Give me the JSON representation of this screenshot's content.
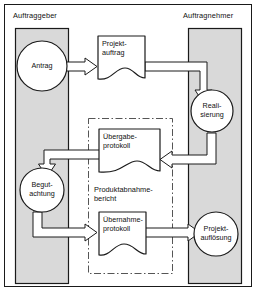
{
  "diagram": {
    "title_alt": "Auftraggeber / Auftragnehmer Projektablauf",
    "type": "flow-diagram",
    "colors": {
      "swimlane_fill": "#d9d9d9",
      "swimlane_stroke": "#1a1a1a",
      "node_fill": "#ffffff",
      "node_stroke": "#1a1a1a",
      "arrow_fill": "#ffffff",
      "arrow_stroke": "#1a1a1a",
      "group_stroke": "#555555",
      "frame_stroke": "#1a1a1a",
      "text": "#111111",
      "page_background": "#ffffff"
    },
    "swimlanes": [
      {
        "id": "auftraggeber",
        "label": "Auftraggeber"
      },
      {
        "id": "auftragnehmer",
        "label": "Auftragnehmer"
      }
    ],
    "group": {
      "id": "produktabnahmebericht",
      "label_line1": "Produktabnahme-",
      "label_line2": "bericht",
      "border_style": "dash-dot"
    },
    "nodes": [
      {
        "id": "antrag",
        "shape": "circle",
        "lane": "auftraggeber",
        "label_line1": "Antrag",
        "label_line2": ""
      },
      {
        "id": "projektauftrag",
        "shape": "document",
        "lane": "between",
        "label_line1": "Projekt-",
        "label_line2": "auftrag"
      },
      {
        "id": "realisierung",
        "shape": "circle",
        "lane": "auftragnehmer",
        "label_line1": "Reali-",
        "label_line2": "sierung"
      },
      {
        "id": "uebergabeprotokoll",
        "shape": "document",
        "lane": "between",
        "label_line1": "Übergabe-",
        "label_line2": "protokoll"
      },
      {
        "id": "begutachtung",
        "shape": "circle",
        "lane": "auftraggeber",
        "label_line1": "Begut-",
        "label_line2": "achtung"
      },
      {
        "id": "uebernahmeprotokoll",
        "shape": "document",
        "lane": "between",
        "label_line1": "Übernahme-",
        "label_line2": "protokoll"
      },
      {
        "id": "projektaufloesung",
        "shape": "circle",
        "lane": "auftragnehmer",
        "label_line1": "Projekt-",
        "label_line2": "auflösung"
      }
    ],
    "edges": [
      {
        "id": "antrag-to-projektauftrag",
        "from": "antrag",
        "to": "projektauftrag",
        "style": "block-arrow"
      },
      {
        "id": "projektauftrag-to-realisierung",
        "from": "projektauftrag",
        "to": "realisierung",
        "style": "block-arrow"
      },
      {
        "id": "realisierung-to-uebergabeprotokoll",
        "from": "realisierung",
        "to": "uebergabeprotokoll",
        "style": "block-arrow"
      },
      {
        "id": "uebergabeprotokoll-to-begutachtung",
        "from": "uebergabeprotokoll",
        "to": "begutachtung",
        "style": "block-arrow"
      },
      {
        "id": "begutachtung-to-uebernahmeprotokoll",
        "from": "begutachtung",
        "to": "uebernahmeprotokoll",
        "style": "block-arrow"
      },
      {
        "id": "uebernahmeprotokoll-to-projektaufloesung",
        "from": "uebernahmeprotokoll",
        "to": "projektaufloesung",
        "style": "block-arrow"
      }
    ]
  }
}
